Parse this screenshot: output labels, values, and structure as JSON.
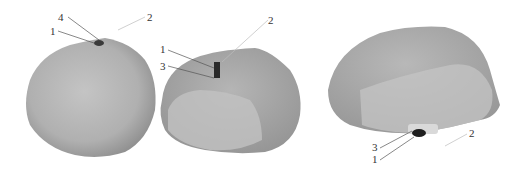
{
  "figure": {
    "panels": [
      {
        "name": "view-front",
        "labels": [
          {
            "text": "4",
            "x": 62,
            "y": 19
          },
          {
            "text": "1",
            "x": 52,
            "y": 34
          },
          {
            "text": "2",
            "x": 148,
            "y": 20
          }
        ]
      },
      {
        "name": "view-angle",
        "labels": [
          {
            "text": "2",
            "x": 270,
            "y": 25
          },
          {
            "text": "1",
            "x": 163,
            "y": 54
          },
          {
            "text": "3",
            "x": 163,
            "y": 71
          }
        ]
      },
      {
        "name": "view-side",
        "labels": [
          {
            "text": "2",
            "x": 470,
            "y": 137
          },
          {
            "text": "3",
            "x": 374,
            "y": 151
          },
          {
            "text": "1",
            "x": 374,
            "y": 163
          }
        ]
      }
    ],
    "colors": {
      "body_dark": "#8f8f8f",
      "body_mid": "#a9a9a9",
      "body_light": "#c4c4c4",
      "component": "#2a2a2a",
      "leader": "#555555"
    }
  }
}
